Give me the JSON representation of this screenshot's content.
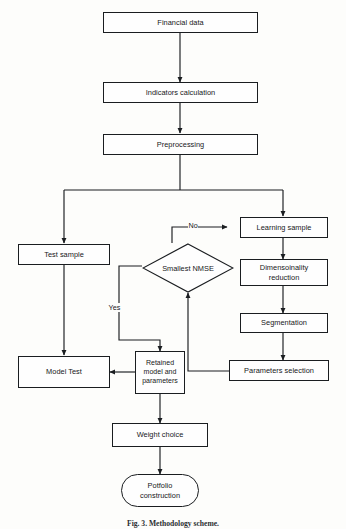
{
  "figure": {
    "type": "flowchart",
    "caption": "Fig. 3. Methodology scheme.",
    "orientation": "top-to-bottom",
    "colors": {
      "background": "#fdfdfb",
      "stroke": "#1a1d20",
      "text": "#16181a",
      "node_fill": "#fefefe"
    }
  },
  "nodes": [
    {
      "id": "financial-data",
      "label": "Financial data",
      "shape": "rectangle"
    },
    {
      "id": "indicators-calculation",
      "label": "Indicators calculation",
      "shape": "rectangle"
    },
    {
      "id": "preprocessing",
      "label": "Preprocessing",
      "shape": "rectangle"
    },
    {
      "id": "test-sample",
      "label": "Test sample",
      "shape": "rectangle"
    },
    {
      "id": "learning-sample",
      "label": "Learning sample",
      "shape": "rectangle"
    },
    {
      "id": "dimensionality-reduction",
      "label": "Dimensoinality\nreduction",
      "line1": "Dimensoinality",
      "line2": "reduction",
      "shape": "rectangle"
    },
    {
      "id": "segmentation",
      "label": "Segmentation",
      "shape": "rectangle"
    },
    {
      "id": "parameters-selection",
      "label": "Parameters selection",
      "shape": "rectangle"
    },
    {
      "id": "smallest-nmse",
      "label": "Smallest NMSE",
      "shape": "diamond"
    },
    {
      "id": "retained-model",
      "label": "Retained model and parameters",
      "line1": "Retained",
      "line2": "model and",
      "line3": "parameters",
      "shape": "rectangle"
    },
    {
      "id": "model-test",
      "label": "Model Test",
      "shape": "rectangle"
    },
    {
      "id": "weight-choice",
      "label": "Weight choice",
      "shape": "rectangle"
    },
    {
      "id": "portfolio-construction",
      "label": "Potfolio construction",
      "line1": "Potfolio",
      "line2": "construction",
      "shape": "terminator"
    }
  ],
  "edges": [
    {
      "from": "financial-data",
      "to": "indicators-calculation",
      "label": ""
    },
    {
      "from": "indicators-calculation",
      "to": "preprocessing",
      "label": ""
    },
    {
      "from": "preprocessing",
      "to": "test-sample",
      "label": ""
    },
    {
      "from": "preprocessing",
      "to": "learning-sample",
      "label": ""
    },
    {
      "from": "smallest-nmse",
      "to": "learning-sample",
      "label": "No"
    },
    {
      "from": "learning-sample",
      "to": "dimensionality-reduction",
      "label": ""
    },
    {
      "from": "dimensionality-reduction",
      "to": "segmentation",
      "label": ""
    },
    {
      "from": "segmentation",
      "to": "parameters-selection",
      "label": ""
    },
    {
      "from": "parameters-selection",
      "to": "smallest-nmse",
      "label": ""
    },
    {
      "from": "smallest-nmse",
      "to": "retained-model",
      "label": "Yes"
    },
    {
      "from": "test-sample",
      "to": "model-test",
      "label": ""
    },
    {
      "from": "retained-model",
      "to": "model-test",
      "label": ""
    },
    {
      "from": "retained-model",
      "to": "weight-choice",
      "label": ""
    },
    {
      "from": "weight-choice",
      "to": "portfolio-construction",
      "label": ""
    }
  ],
  "edge_labels": {
    "no": "No",
    "yes": "Yes"
  }
}
